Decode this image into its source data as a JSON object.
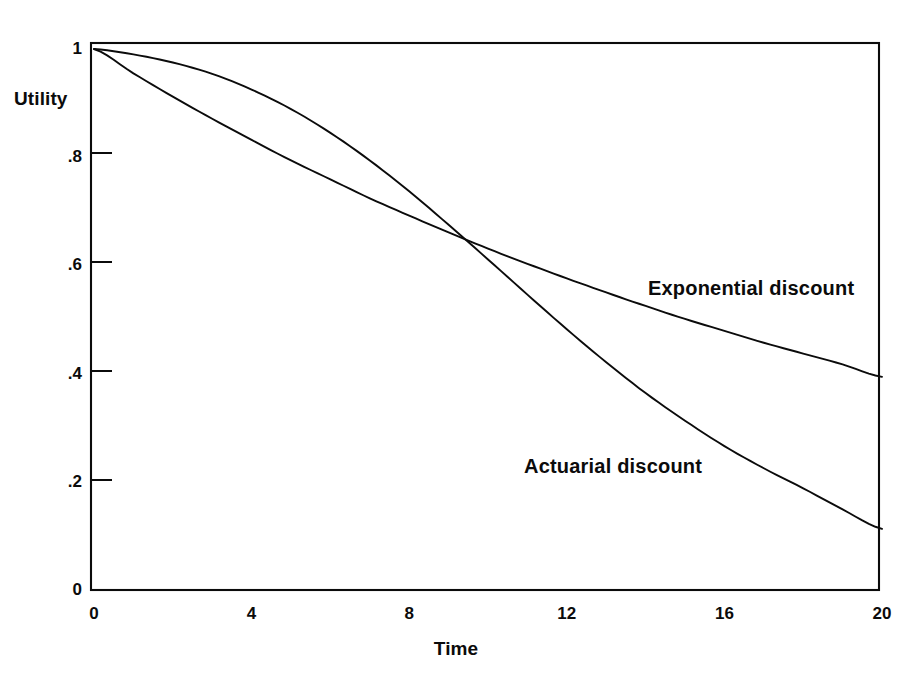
{
  "figure": {
    "background_color": "#ffffff",
    "ink_color": "#0b0b0b"
  },
  "chart_data": {
    "type": "line",
    "title": "",
    "xlabel": "Time",
    "ylabel": "Utility",
    "xlim": [
      0,
      20
    ],
    "ylim": [
      0,
      1
    ],
    "xticks": [
      0,
      4,
      8,
      12,
      16,
      20
    ],
    "xtick_labels": [
      "0",
      "4",
      "8",
      "12",
      "16",
      "20"
    ],
    "yticks": [
      0,
      0.2,
      0.4,
      0.6,
      0.8,
      1
    ],
    "ytick_labels": [
      "0",
      ".2",
      ".4",
      ".6",
      ".8",
      "1"
    ],
    "grid": false,
    "legend_position": "inline-annotations",
    "frame": "box",
    "x": [
      0,
      1,
      2,
      3,
      4,
      5,
      6,
      7,
      8,
      9,
      10,
      11,
      12,
      13,
      14,
      15,
      16,
      17,
      18,
      19,
      20
    ],
    "series": [
      {
        "name": "Exponential discount",
        "annotation": "Exponential discount",
        "values": [
          1.0,
          0.955,
          0.912,
          0.871,
          0.832,
          0.794,
          0.759,
          0.724,
          0.692,
          0.661,
          0.631,
          0.603,
          0.576,
          0.55,
          0.525,
          0.501,
          0.479,
          0.457,
          0.437,
          0.417,
          0.394
        ]
      },
      {
        "name": "Actuarial discount",
        "annotation": "Actuarial discount",
        "values": [
          1.0,
          0.99,
          0.975,
          0.954,
          0.925,
          0.889,
          0.845,
          0.794,
          0.737,
          0.675,
          0.611,
          0.546,
          0.482,
          0.421,
          0.364,
          0.313,
          0.266,
          0.225,
          0.188,
          0.149,
          0.113
        ]
      }
    ],
    "annotations": [
      {
        "text": "Exponential discount",
        "x": 14.1,
        "y": 0.545
      },
      {
        "text": "Actuarial discount",
        "x": 11.0,
        "y": 0.225
      }
    ]
  }
}
